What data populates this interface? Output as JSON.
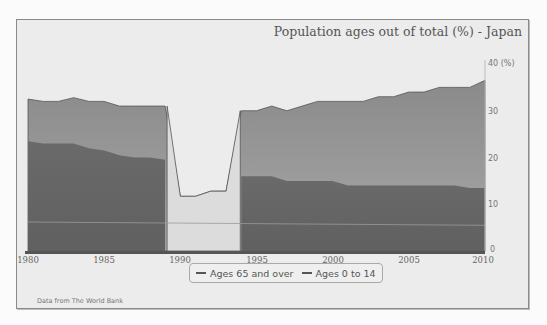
{
  "chart_data": {
    "type": "area",
    "title": "Population ages out of total (%) - Japan",
    "xlabel": "",
    "ylabel": "(%)",
    "x": [
      1980,
      1981,
      1982,
      1983,
      1984,
      1985,
      1986,
      1987,
      1988,
      1989,
      1990,
      1991,
      1992,
      1993,
      1994,
      1995,
      1996,
      1997,
      1998,
      1999,
      2000,
      2001,
      2002,
      2003,
      2004,
      2005,
      2006,
      2007,
      2008,
      2009,
      2010
    ],
    "series": [
      {
        "name": "Ages 65 and over",
        "note": "stacked top boundary (total)",
        "values": [
          32.5,
          32,
          32,
          32.8,
          32,
          32,
          31,
          31,
          31,
          31,
          11.7,
          11.7,
          12.8,
          12.8,
          30,
          30,
          31,
          30,
          31,
          32,
          32,
          32,
          32,
          33,
          33,
          34,
          34,
          35,
          35,
          35,
          36.5
        ]
      },
      {
        "name": "Ages 0 to 14",
        "values": [
          23.5,
          23,
          23,
          23,
          22,
          21.5,
          20.5,
          20,
          20,
          19.5,
          null,
          null,
          null,
          null,
          16,
          16,
          16,
          15,
          15,
          15,
          15,
          14,
          14,
          14,
          14,
          14,
          14,
          14,
          14,
          13.5,
          13.5
        ]
      }
    ],
    "xticks": [
      "1980",
      "1985",
      "1990",
      "1995",
      "2000",
      "2005",
      "2010"
    ],
    "yticks": [
      "0",
      "10",
      "20",
      "30",
      "40 (%)"
    ],
    "ylim": [
      0,
      40
    ],
    "grid": false,
    "legend_position": "bottom"
  },
  "chart": {
    "title": "Population ages out of total (%) - Japan",
    "legend": [
      "Ages 65 and over",
      "Ages 0 to 14"
    ],
    "source": "Data from The World Bank",
    "colors": {
      "upper_area": "#8f8f8f",
      "lower_area": "#666666",
      "gap_area": "#dcdcdc",
      "background": "#ececec"
    }
  }
}
